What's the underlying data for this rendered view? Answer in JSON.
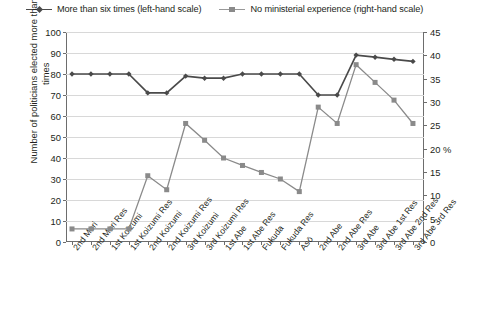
{
  "legend": {
    "items": [
      {
        "label": "More than six times (left-hand scale)",
        "color": "#4a4a4a",
        "marker": "diamond-marker"
      },
      {
        "label": "No ministerial experience (right-hand scale)",
        "color": "#8a8a8a",
        "marker": "square-marker"
      }
    ]
  },
  "axes": {
    "y_left_title": "Number of politicians elected more than six times",
    "y_left_ticks": [
      "0",
      "10",
      "20",
      "30",
      "40",
      "50",
      "60",
      "70",
      "80",
      "90",
      "100"
    ],
    "y_right_ticks": [
      "0",
      "5",
      "10",
      "15",
      "20 %",
      "25",
      "30",
      "35",
      "40",
      "45"
    ],
    "y_right_unit": "%"
  },
  "chart_data": {
    "type": "line",
    "title": "",
    "xlabel": "",
    "ylabel": "Number of politicians elected more than six times",
    "ylim": [
      0,
      100
    ],
    "y2lim": [
      0,
      45
    ],
    "grid": true,
    "legend_position": "top",
    "categories": [
      "2nd Mori",
      "2nd Mori Res",
      "1st Koizumi",
      "1st Koizumi Res",
      "2nd Koizumi",
      "2nd Koizumi Res",
      "3rd Koizumi",
      "3rd Koizumi Res",
      "1st Abe",
      "1st Abe Res",
      "Fukuda",
      "Fukuda Res",
      "Asō",
      "2nd Abe",
      "2nd Abe Res",
      "3rd Abe",
      "3rd Abe 1st Res",
      "3rd Abe 2nd Res",
      "3rd Abe 3rd Res"
    ],
    "series": [
      {
        "name": "More than six times (left-hand scale)",
        "axis": "left",
        "color": "#4a4a4a",
        "values": [
          80,
          80,
          80,
          80,
          71,
          71,
          79,
          78,
          78,
          80,
          80,
          80,
          80,
          70,
          70,
          89,
          88,
          87,
          86
        ]
      },
      {
        "name": "No ministerial experience (right-hand scale)",
        "axis": "right",
        "color": "#8a8a8a",
        "values": [
          2.8,
          2.8,
          2.8,
          2.8,
          14.2,
          11.2,
          25.4,
          21.8,
          18.0,
          16.4,
          14.9,
          13.5,
          10.8,
          28.9,
          25.4,
          38.0,
          34.2,
          30.4,
          25.4
        ]
      }
    ]
  }
}
